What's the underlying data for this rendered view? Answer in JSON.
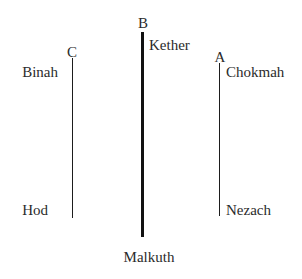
{
  "diagram": {
    "background_color": "#ffffff",
    "ink_color": "#2b2b2b",
    "line_color": "#1d1d1d",
    "pillars": [
      {
        "letter": "C",
        "name": "left-pillar",
        "top_label": "Binah",
        "bottom_label": "Hod",
        "weight": "thin",
        "x": 72,
        "y_top": 58,
        "y_bottom": 218
      },
      {
        "letter": "B",
        "name": "middle-pillar",
        "top_label": "Kether",
        "bottom_label": "Malkuth",
        "weight": "thick",
        "x": 142,
        "y_top": 32,
        "y_bottom": 237
      },
      {
        "letter": "A",
        "name": "right-pillar",
        "top_label": "Chokmah",
        "bottom_label": "Nezach",
        "weight": "thin",
        "x": 219,
        "y_top": 63,
        "y_bottom": 216
      }
    ]
  }
}
